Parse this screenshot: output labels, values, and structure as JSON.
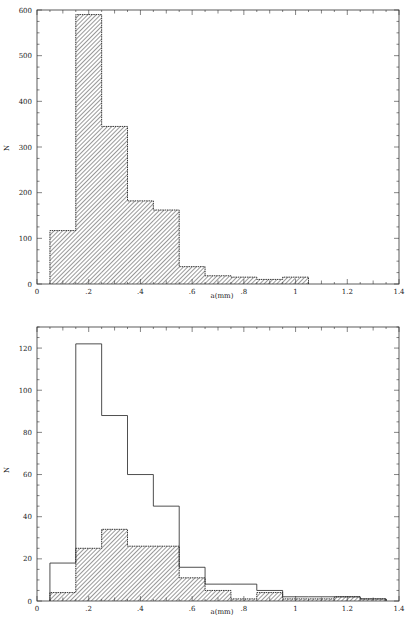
{
  "chart_data": [
    {
      "type": "bar",
      "title": "",
      "xlabel": "a(mm)",
      "ylabel": "N",
      "xlim": [
        0,
        1.4
      ],
      "ylim": [
        0,
        600
      ],
      "x_ticks": [
        "0",
        ".2",
        ".4",
        ".6",
        ".8",
        "1",
        "1.2",
        "1.4"
      ],
      "y_ticks": [
        "0",
        "100",
        "200",
        "300",
        "400",
        "500",
        "600"
      ],
      "bin_width": 0.1,
      "bin_edges": [
        0.05,
        0.15,
        0.25,
        0.35,
        0.45,
        0.55,
        0.65,
        0.75,
        0.85,
        0.95,
        1.05
      ],
      "series": [
        {
          "name": "all",
          "style": "hatched",
          "values": [
            117,
            590,
            345,
            182,
            162,
            38,
            18,
            15,
            10,
            15
          ]
        }
      ],
      "grid": false
    },
    {
      "type": "bar",
      "title": "",
      "xlabel": "a(mm)",
      "ylabel": "N",
      "xlim": [
        0,
        1.4
      ],
      "ylim": [
        0,
        130
      ],
      "x_ticks": [
        "0",
        ".2",
        ".4",
        ".6",
        ".8",
        "1",
        "1.2",
        "1.4"
      ],
      "y_ticks": [
        "0",
        "20",
        "40",
        "60",
        "80",
        "100",
        "120"
      ],
      "bin_width": 0.1,
      "bin_edges": [
        0.05,
        0.15,
        0.25,
        0.35,
        0.45,
        0.55,
        0.65,
        0.75,
        0.85,
        0.95,
        1.05,
        1.15,
        1.25,
        1.35
      ],
      "series": [
        {
          "name": "open",
          "style": "outline",
          "values": [
            18,
            122,
            88,
            60,
            45,
            16,
            8,
            8,
            5,
            2,
            2,
            2,
            1
          ]
        },
        {
          "name": "hatched",
          "style": "hatched",
          "values": [
            4,
            25,
            34,
            26,
            26,
            11,
            5,
            1,
            4,
            1,
            1,
            2,
            1
          ]
        }
      ],
      "grid": false
    }
  ],
  "labels": {
    "top": {
      "xlabel": "a(mm)",
      "ylabel": "N"
    },
    "bottom": {
      "xlabel": "a(mm)",
      "ylabel": "N"
    }
  }
}
